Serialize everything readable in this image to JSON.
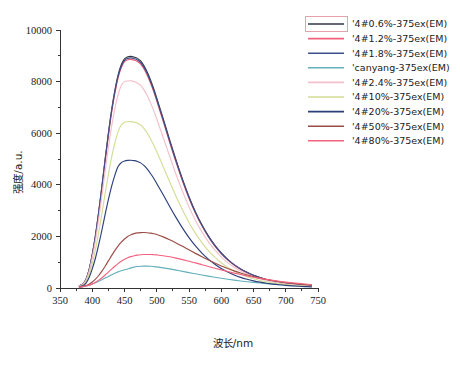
{
  "chart_data": {
    "type": "line",
    "title": "",
    "xlabel": "波长/nm",
    "ylabel": "强度/a.u.",
    "xlim": [
      350,
      750
    ],
    "ylim": [
      0,
      10000
    ],
    "xticks": [
      350,
      400,
      450,
      500,
      550,
      600,
      650,
      700,
      750
    ],
    "xtick_labels": [
      "350",
      "400",
      "450",
      "500",
      "550",
      "600",
      "650",
      "700",
      "750"
    ],
    "yticks": [
      0,
      2000,
      4000,
      6000,
      8000,
      10000
    ],
    "ytick_labels": [
      "0",
      "2000",
      "4000",
      "6000",
      "8000",
      "10000"
    ],
    "x_minor_step": 25,
    "y_minor_step": 1000,
    "grid": false,
    "legend_position": "top-right",
    "x": [
      380,
      385,
      390,
      395,
      400,
      405,
      410,
      415,
      420,
      425,
      430,
      435,
      440,
      445,
      450,
      455,
      460,
      465,
      470,
      475,
      480,
      485,
      490,
      495,
      500,
      510,
      520,
      530,
      540,
      550,
      560,
      570,
      580,
      590,
      600,
      610,
      620,
      630,
      640,
      650,
      660,
      670,
      680,
      690,
      700,
      710,
      720,
      730,
      740
    ],
    "series": [
      {
        "name": "'4#0.6%-375ex(EM)",
        "color": "#33353f",
        "peak_x": 478,
        "peak_y": 8980,
        "values": [
          95,
          150,
          320,
          700,
          1300,
          2050,
          2950,
          3950,
          5000,
          6000,
          6900,
          7650,
          8250,
          8650,
          8880,
          8960,
          8980,
          8950,
          8900,
          8800,
          8620,
          8380,
          8080,
          7740,
          7360,
          6560,
          5740,
          4950,
          4210,
          3540,
          2950,
          2450,
          2020,
          1660,
          1360,
          1110,
          905,
          740,
          605,
          495,
          405,
          330,
          270,
          220,
          180,
          148,
          122,
          100,
          82
        ]
      },
      {
        "name": "'4#1.2%-375ex(EM)",
        "color": "#f2607a",
        "peak_x": 477,
        "peak_y": 8860,
        "values": [
          90,
          145,
          310,
          680,
          1270,
          2000,
          2890,
          3880,
          4920,
          5910,
          6800,
          7540,
          8140,
          8540,
          8770,
          8845,
          8860,
          8830,
          8780,
          8680,
          8500,
          8260,
          7960,
          7630,
          7250,
          6460,
          5650,
          4870,
          4140,
          3480,
          2900,
          2410,
          1985,
          1630,
          1335,
          1090,
          890,
          726,
          594,
          486,
          398,
          324,
          265,
          216,
          177,
          145,
          120,
          98,
          80
        ]
      },
      {
        "name": "'4#1.8%-375ex(EM)",
        "color": "#3c4f8a",
        "peak_x": 479,
        "peak_y": 8920,
        "values": [
          92,
          148,
          315,
          690,
          1285,
          2025,
          2920,
          3915,
          4960,
          5955,
          6850,
          7595,
          8195,
          8595,
          8825,
          8900,
          8920,
          8890,
          8840,
          8740,
          8560,
          8320,
          8020,
          7685,
          7305,
          6510,
          5695,
          4910,
          4175,
          3510,
          2925,
          2430,
          2002,
          1645,
          1347,
          1100,
          897,
          733,
          599,
          490,
          401,
          327,
          267,
          218,
          178,
          146,
          121,
          99,
          81
        ]
      },
      {
        "name": "'canyang-375ex(EM)",
        "color": "#63b0bc",
        "peak_x": 492,
        "peak_y": 850,
        "values": [
          30,
          45,
          70,
          105,
          150,
          200,
          258,
          320,
          385,
          450,
          513,
          572,
          625,
          670,
          706,
          734,
          780,
          810,
          832,
          845,
          850,
          848,
          842,
          832,
          818,
          782,
          740,
          694,
          646,
          598,
          550,
          503,
          458,
          416,
          376,
          339,
          304,
          272,
          243,
          216,
          192,
          170,
          150,
          132,
          116,
          102,
          89,
          78,
          68
        ]
      },
      {
        "name": "'4#2.4%-375ex(EM)",
        "color": "#f3c0cb",
        "peak_x": 477,
        "peak_y": 8030,
        "values": [
          85,
          135,
          290,
          630,
          1175,
          1850,
          2670,
          3580,
          4540,
          5450,
          6265,
          6945,
          7490,
          7850,
          8000,
          8025,
          8030,
          8000,
          7950,
          7855,
          7690,
          7470,
          7195,
          6895,
          6550,
          5835,
          5105,
          4400,
          3740,
          3145,
          2620,
          2175,
          1795,
          1475,
          1208,
          985,
          805,
          656,
          537,
          439,
          360,
          293,
          240,
          196,
          160,
          131,
          108,
          89,
          73
        ]
      },
      {
        "name": "'4#10%-375ex(EM)",
        "color": "#d5dd96",
        "peak_x": 480,
        "peak_y": 6450,
        "values": [
          70,
          110,
          235,
          510,
          950,
          1495,
          2155,
          2890,
          3665,
          4400,
          5060,
          5610,
          6050,
          6320,
          6420,
          6445,
          6450,
          6430,
          6390,
          6320,
          6190,
          6015,
          5795,
          5555,
          5280,
          4705,
          4115,
          3550,
          3020,
          2540,
          2118,
          1760,
          1452,
          1194,
          978,
          799,
          653,
          533,
          436,
          357,
          292,
          238,
          195,
          159,
          130,
          107,
          88,
          72,
          59
        ]
      },
      {
        "name": "'4#20%-375ex(EM)",
        "color": "#2b3f7a",
        "peak_x": 481,
        "peak_y": 4950,
        "values": [
          55,
          86,
          183,
          397,
          740,
          1163,
          1677,
          2248,
          2852,
          3425,
          3938,
          4366,
          4709,
          4860,
          4920,
          4945,
          4950,
          4935,
          4905,
          4850,
          4750,
          4615,
          4447,
          4263,
          4052,
          3612,
          3160,
          2727,
          2320,
          1952,
          1629,
          1354,
          1118,
          920,
          754,
          617,
          504,
          412,
          337,
          276,
          226,
          185,
          151,
          124,
          101,
          83,
          68,
          56,
          46
        ]
      },
      {
        "name": "'4#50%-375ex(EM)",
        "color": "#9a4d46",
        "peak_x": 484,
        "peak_y": 2150,
        "values": [
          40,
          60,
          95,
          150,
          235,
          345,
          485,
          655,
          845,
          1050,
          1255,
          1450,
          1625,
          1775,
          1900,
          1995,
          2062,
          2108,
          2135,
          2148,
          2150,
          2143,
          2128,
          2105,
          2072,
          1982,
          1872,
          1748,
          1615,
          1478,
          1342,
          1210,
          1084,
          966,
          856,
          755,
          663,
          580,
          506,
          440,
          381,
          329,
          284,
          244,
          209,
          179,
          153,
          130,
          111
        ]
      },
      {
        "name": "'4#80%-375ex(EM)",
        "color": "#f4627f",
        "peak_x": 487,
        "peak_y": 1300,
        "values": [
          38,
          52,
          75,
          110,
          160,
          225,
          305,
          400,
          505,
          618,
          732,
          842,
          944,
          1034,
          1110,
          1170,
          1215,
          1248,
          1272,
          1288,
          1297,
          1300,
          1298,
          1292,
          1282,
          1252,
          1210,
          1158,
          1100,
          1038,
          972,
          904,
          836,
          768,
          702,
          638,
          578,
          521,
          468,
          419,
          374,
          333,
          295,
          261,
          230,
          202,
          177,
          154,
          134
        ]
      }
    ]
  },
  "legend": {
    "selected_index": 0,
    "entries": [
      {
        "label": "'4#0.6%-375ex(EM)",
        "color": "#33353f"
      },
      {
        "label": "'4#1.2%-375ex(EM)",
        "color": "#f2607a"
      },
      {
        "label": "'4#1.8%-375ex(EM)",
        "color": "#3c4f8a"
      },
      {
        "label": "'canyang-375ex(EM)",
        "color": "#63b0bc"
      },
      {
        "label": "'4#2.4%-375ex(EM)",
        "color": "#f3c0cb"
      },
      {
        "label": "'4#10%-375ex(EM)",
        "color": "#d5dd96"
      },
      {
        "label": "'4#20%-375ex(EM)",
        "color": "#2b3f7a"
      },
      {
        "label": "'4#50%-375ex(EM)",
        "color": "#9a4d46"
      },
      {
        "label": "'4#80%-375ex(EM)",
        "color": "#f4627f"
      }
    ]
  }
}
